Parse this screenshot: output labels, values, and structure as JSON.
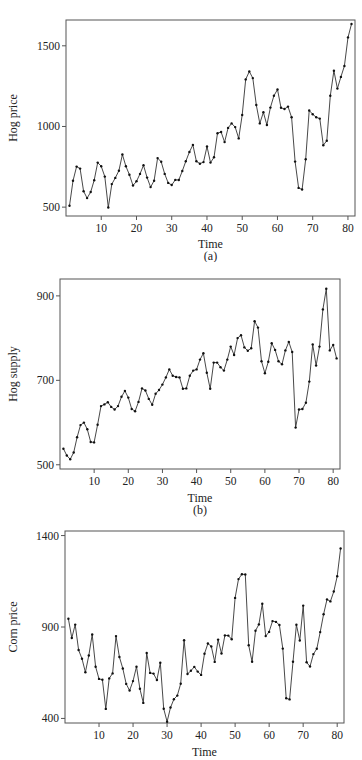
{
  "figure": {
    "panels": [
      "(a)",
      "(b)",
      ""
    ]
  },
  "chart_data": [
    {
      "type": "line",
      "title": "",
      "panel_label": "(a)",
      "xlabel": "Time",
      "ylabel": "Hog price",
      "xlim": [
        0,
        82
      ],
      "ylim": [
        445,
        1660
      ],
      "xticks": [
        10,
        20,
        30,
        40,
        50,
        60,
        70,
        80
      ],
      "yticks": [
        500,
        1000,
        1500
      ],
      "grid": false,
      "legend": false,
      "markers": true,
      "x_start": 1,
      "values": [
        509,
        663,
        751,
        739,
        598,
        556,
        594,
        667,
        776,
        754,
        689,
        498,
        643,
        681,
        726,
        826,
        753,
        701,
        634,
        660,
        706,
        759,
        683,
        624,
        664,
        804,
        781,
        706,
        650,
        637,
        669,
        668,
        724,
        784,
        842,
        886,
        784,
        769,
        779,
        876,
        776,
        809,
        958,
        966,
        903,
        991,
        1019,
        996,
        926,
        1071,
        1292,
        1341,
        1300,
        1133,
        1019,
        1088,
        1009,
        1117,
        1190,
        1229,
        1116,
        1108,
        1123,
        1057,
        782,
        619,
        609,
        797,
        1099,
        1076,
        1057,
        1049,
        884,
        912,
        1190,
        1346,
        1235,
        1307,
        1375,
        1552,
        1635
      ]
    },
    {
      "type": "line",
      "title": "",
      "panel_label": "(b)",
      "xlabel": "Time",
      "ylabel": "Hog supply",
      "xlim": [
        0,
        82
      ],
      "ylim": [
        490,
        940
      ],
      "xticks": [
        10,
        20,
        30,
        40,
        50,
        60,
        70,
        80
      ],
      "yticks": [
        500,
        700,
        900
      ],
      "grid": false,
      "legend": false,
      "markers": true,
      "x_start": 1,
      "values": [
        538,
        522,
        513,
        529,
        565,
        594,
        600,
        584,
        554,
        553,
        595,
        639,
        643,
        648,
        637,
        631,
        639,
        661,
        675,
        659,
        632,
        627,
        649,
        681,
        676,
        656,
        642,
        668,
        677,
        690,
        707,
        726,
        711,
        708,
        707,
        680,
        681,
        711,
        723,
        726,
        749,
        764,
        718,
        680,
        742,
        742,
        731,
        723,
        749,
        780,
        760,
        800,
        807,
        778,
        770,
        776,
        840,
        825,
        745,
        717,
        744,
        788,
        772,
        745,
        738,
        771,
        791,
        767,
        588,
        631,
        632,
        647,
        697,
        785,
        735,
        780,
        868,
        917,
        771,
        784,
        752
      ]
    },
    {
      "type": "line",
      "title": "",
      "panel_label": "",
      "xlabel": "Time",
      "ylabel": "Corn price",
      "xlim": [
        0,
        82
      ],
      "ylim": [
        375,
        1425
      ],
      "xticks": [
        10,
        20,
        30,
        40,
        50,
        60,
        70,
        80
      ],
      "yticks": [
        400,
        900,
        1400
      ],
      "grid": false,
      "legend": false,
      "markers": true,
      "x_start": 1,
      "values": [
        945,
        840,
        913,
        774,
        726,
        653,
        744,
        859,
        683,
        616,
        612,
        452,
        619,
        646,
        850,
        736,
        673,
        589,
        553,
        604,
        683,
        562,
        485,
        758,
        649,
        645,
        610,
        705,
        453,
        382,
        460,
        505,
        525,
        590,
        828,
        643,
        661,
        682,
        656,
        638,
        754,
        810,
        794,
        709,
        831,
        755,
        854,
        853,
        833,
        1059,
        1162,
        1189,
        1187,
        800,
        710,
        880,
        914,
        1027,
        850,
        873,
        932,
        928,
        911,
        782,
        510,
        504,
        710,
        912,
        826,
        1017,
        707,
        684,
        752,
        781,
        872,
        970,
        1051,
        1040,
        1094,
        1177,
        1330
      ]
    }
  ]
}
